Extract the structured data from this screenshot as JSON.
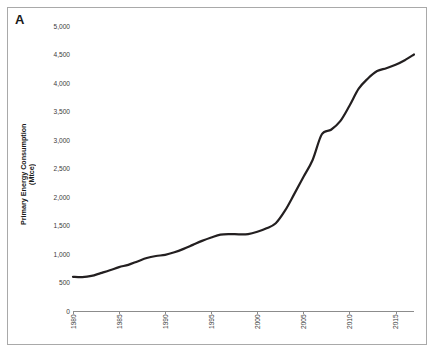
{
  "figure": {
    "panel_label": "A",
    "background_color": "#ffffff",
    "border_color": "#a9a9a9",
    "line_color": "#231f20",
    "axis_color": "#8c8c8c",
    "tick_text_color": "#3a3a3a"
  },
  "axes": {
    "y_title_main": "Primary Energy Consumption",
    "y_title_unit": "(Mtce)",
    "y_tick_labels": [
      "5,000",
      "4,500",
      "4,000",
      "3,500",
      "3,000",
      "2,500",
      "2,000",
      "1,500",
      "1,000",
      "500",
      "0"
    ],
    "x_tick_labels": [
      "1980",
      "1985",
      "1990",
      "1995",
      "2000",
      "2005",
      "2010",
      "2015"
    ]
  },
  "chart_data": {
    "type": "line",
    "title": "A",
    "xlabel": "",
    "ylabel": "Primary Energy Consumption (Mtce)",
    "unit": "Mtce",
    "xlim": [
      1980,
      2017
    ],
    "ylim": [
      0,
      5000
    ],
    "ytick_step": 500,
    "xtick_step": 5,
    "grid": false,
    "legend": false,
    "x": [
      1980,
      1981,
      1982,
      1983,
      1984,
      1985,
      1986,
      1987,
      1988,
      1989,
      1990,
      1991,
      1992,
      1993,
      1994,
      1995,
      1996,
      1997,
      1998,
      1999,
      2000,
      2001,
      2002,
      2003,
      2004,
      2005,
      2006,
      2007,
      2008,
      2009,
      2010,
      2011,
      2012,
      2013,
      2014,
      2015,
      2016,
      2017
    ],
    "series": [
      {
        "name": "Primary Energy Consumption",
        "values": [
          600,
          595,
          615,
          665,
          715,
          770,
          810,
          870,
          930,
          965,
          985,
          1030,
          1090,
          1160,
          1230,
          1290,
          1340,
          1350,
          1345,
          1350,
          1390,
          1450,
          1540,
          1760,
          2050,
          2350,
          2650,
          3100,
          3180,
          3330,
          3600,
          3900,
          4080,
          4210,
          4260,
          4320,
          4400,
          4500
        ]
      }
    ]
  }
}
